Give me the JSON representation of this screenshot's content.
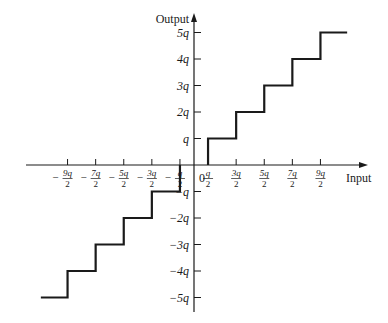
{
  "diagram": {
    "type": "quantizer staircase (mid-tread)",
    "axes": {
      "x_label": "Input",
      "y_label": "Output",
      "origin_label": "0"
    },
    "x_ticks": [
      {
        "sign": "−",
        "num": "9q",
        "den": "2",
        "value": -4.5
      },
      {
        "sign": "−",
        "num": "7q",
        "den": "2",
        "value": -3.5
      },
      {
        "sign": "−",
        "num": "5q",
        "den": "2",
        "value": -2.5
      },
      {
        "sign": "−",
        "num": "3q",
        "den": "2",
        "value": -1.5
      },
      {
        "sign": "−",
        "num": "q",
        "den": "2",
        "value": -0.5
      },
      {
        "sign": "",
        "num": "q",
        "den": "2",
        "value": 0.5
      },
      {
        "sign": "",
        "num": "3q",
        "den": "2",
        "value": 1.5
      },
      {
        "sign": "",
        "num": "5q",
        "den": "2",
        "value": 2.5
      },
      {
        "sign": "",
        "num": "7q",
        "den": "2",
        "value": 3.5
      },
      {
        "sign": "",
        "num": "9q",
        "den": "2",
        "value": 4.5
      }
    ],
    "y_ticks": [
      {
        "label": "5q",
        "value": 5
      },
      {
        "label": "4q",
        "value": 4
      },
      {
        "label": "3q",
        "value": 3
      },
      {
        "label": "2q",
        "value": 2
      },
      {
        "label": "q",
        "value": 1
      },
      {
        "label": "−q",
        "value": -1
      },
      {
        "label": "−2q",
        "value": -2
      },
      {
        "label": "−3q",
        "value": -3
      },
      {
        "label": "−4q",
        "value": -4
      },
      {
        "label": "−5q",
        "value": -5
      }
    ],
    "levels": [
      -5,
      -4,
      -3,
      -2,
      -1,
      0,
      1,
      2,
      3,
      4,
      5
    ],
    "step_edges": [
      -4.5,
      -3.5,
      -2.5,
      -1.5,
      -0.5,
      0.5,
      1.5,
      2.5,
      3.5,
      4.5
    ],
    "line_color": "#1a1a1a"
  }
}
